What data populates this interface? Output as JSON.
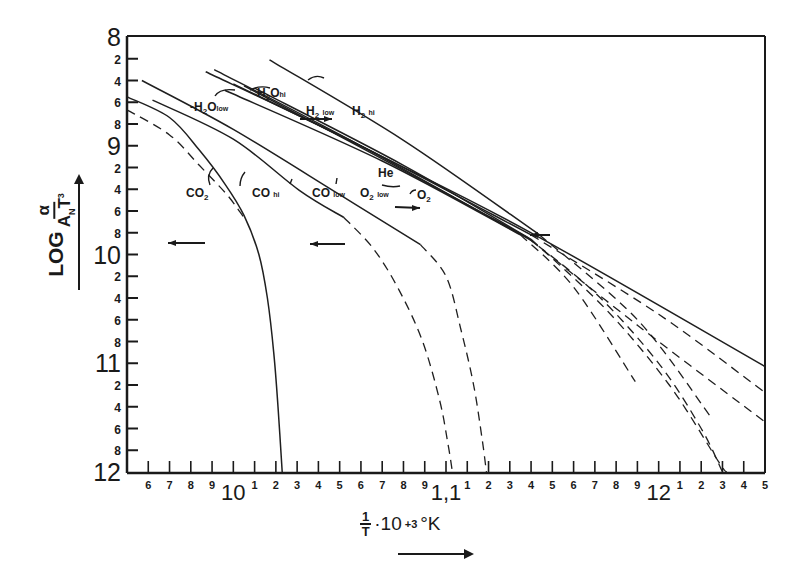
{
  "chart_data": {
    "type": "line",
    "title": "",
    "xlabel": "1/T · 10^+3 °K",
    "ylabel": "LOG α/(A_N T³)",
    "xlim": [
      0.95,
      1.25
    ],
    "ylim": [
      8,
      12
    ],
    "y_inverted": true,
    "grid": false,
    "legend_position": "inline annotations",
    "x_ticks": [
      {
        "value": 0.96,
        "label": "6"
      },
      {
        "value": 0.97,
        "label": "7"
      },
      {
        "value": 0.98,
        "label": "8"
      },
      {
        "value": 0.99,
        "label": "9"
      },
      {
        "value": 1.0,
        "label": "10"
      },
      {
        "value": 1.01,
        "label": "1"
      },
      {
        "value": 1.02,
        "label": "2"
      },
      {
        "value": 1.03,
        "label": "3"
      },
      {
        "value": 1.04,
        "label": "4"
      },
      {
        "value": 1.05,
        "label": "5"
      },
      {
        "value": 1.06,
        "label": "6"
      },
      {
        "value": 1.07,
        "label": "7"
      },
      {
        "value": 1.08,
        "label": "8"
      },
      {
        "value": 1.09,
        "label": "9"
      },
      {
        "value": 1.1,
        "label": "1,1"
      },
      {
        "value": 1.11,
        "label": "1"
      },
      {
        "value": 1.12,
        "label": "2"
      },
      {
        "value": 1.13,
        "label": "3"
      },
      {
        "value": 1.14,
        "label": "4"
      },
      {
        "value": 1.15,
        "label": "5"
      },
      {
        "value": 1.16,
        "label": "6"
      },
      {
        "value": 1.17,
        "label": "7"
      },
      {
        "value": 1.18,
        "label": "8"
      },
      {
        "value": 1.19,
        "label": "9"
      },
      {
        "value": 1.2,
        "label": "12"
      },
      {
        "value": 1.21,
        "label": "1"
      },
      {
        "value": 1.22,
        "label": "2"
      },
      {
        "value": 1.23,
        "label": "3"
      },
      {
        "value": 1.24,
        "label": "4"
      },
      {
        "value": 1.25,
        "label": "5"
      }
    ],
    "y_ticks": [
      {
        "value": 8.0,
        "label": "8",
        "major": true
      },
      {
        "value": 8.2,
        "label": "2"
      },
      {
        "value": 8.4,
        "label": "4"
      },
      {
        "value": 8.6,
        "label": "6"
      },
      {
        "value": 8.8,
        "label": "8"
      },
      {
        "value": 9.0,
        "label": "9",
        "major": true
      },
      {
        "value": 9.2,
        "label": "2"
      },
      {
        "value": 9.4,
        "label": "4"
      },
      {
        "value": 9.6,
        "label": "6"
      },
      {
        "value": 9.8,
        "label": "8"
      },
      {
        "value": 10.0,
        "label": "10",
        "major": true
      },
      {
        "value": 10.2,
        "label": "2"
      },
      {
        "value": 10.4,
        "label": "4"
      },
      {
        "value": 10.6,
        "label": "6"
      },
      {
        "value": 10.8,
        "label": "8"
      },
      {
        "value": 11.0,
        "label": "11",
        "major": true
      },
      {
        "value": 11.2,
        "label": "2"
      },
      {
        "value": 11.4,
        "label": "4"
      },
      {
        "value": 11.6,
        "label": "6"
      },
      {
        "value": 11.8,
        "label": "8"
      },
      {
        "value": 12.0,
        "label": "12",
        "major": true
      }
    ],
    "series": [
      {
        "name": "CO2",
        "style": "solid",
        "points": [
          [
            0.95,
            8.55
          ],
          [
            0.97,
            8.74
          ],
          [
            0.984,
            9.04
          ],
          [
            0.996,
            9.35
          ],
          [
            1.005,
            9.64
          ],
          [
            1.012,
            10.0
          ],
          [
            1.016,
            10.4
          ],
          [
            1.019,
            10.9
          ],
          [
            1.021,
            11.4
          ],
          [
            1.023,
            12.0
          ]
        ]
      },
      {
        "name": "CO2 (dashed)",
        "style": "dashed",
        "points": [
          [
            0.95,
            8.67
          ],
          [
            0.97,
            8.9
          ],
          [
            0.984,
            9.18
          ],
          [
            0.997,
            9.45
          ],
          [
            1.005,
            9.66
          ]
        ]
      },
      {
        "name": "CO hi",
        "style": "solid",
        "points": [
          [
            0.962,
            8.58
          ],
          [
            1.0,
            8.94
          ],
          [
            1.031,
            9.41
          ],
          [
            1.052,
            9.66
          ]
        ]
      },
      {
        "name": "CO hi (extrap.)",
        "style": "dashed",
        "points": [
          [
            1.052,
            9.66
          ],
          [
            1.066,
            9.95
          ],
          [
            1.078,
            10.33
          ],
          [
            1.089,
            10.8
          ],
          [
            1.097,
            11.34
          ],
          [
            1.101,
            11.75
          ],
          [
            1.103,
            12.0
          ]
        ]
      },
      {
        "name": "CO low",
        "style": "solid",
        "points": [
          [
            0.957,
            8.4
          ],
          [
            1.0,
            8.85
          ],
          [
            1.05,
            9.45
          ],
          [
            1.088,
            9.91
          ]
        ]
      },
      {
        "name": "CO low (extrap.)",
        "style": "dashed",
        "points": [
          [
            1.088,
            9.91
          ],
          [
            1.1,
            10.2
          ],
          [
            1.107,
            10.69
          ],
          [
            1.113,
            11.2
          ],
          [
            1.117,
            11.7
          ],
          [
            1.119,
            12.0
          ]
        ]
      },
      {
        "name": "O2 low",
        "style": "solid",
        "points": [
          [
            0.991,
            8.3
          ],
          [
            1.06,
            9.0
          ],
          [
            1.14,
            9.87
          ]
        ]
      },
      {
        "name": "O2 low (extrap.)",
        "style": "dashed",
        "points": [
          [
            1.14,
            9.87
          ],
          [
            1.19,
            10.65
          ],
          [
            1.25,
            11.54
          ]
        ]
      },
      {
        "name": "H2O low",
        "style": "solid",
        "points": [
          [
            0.996,
            8.49
          ],
          [
            1.07,
            9.14
          ],
          [
            1.135,
            9.82
          ]
        ]
      },
      {
        "name": "H2O low (extrap.)",
        "style": "dashed",
        "points": [
          [
            1.135,
            9.82
          ],
          [
            1.16,
            10.3
          ],
          [
            1.189,
            11.17
          ]
        ]
      },
      {
        "name": "H2O hi",
        "style": "solid",
        "points": [
          [
            1.0,
            8.43
          ],
          [
            1.07,
            9.1
          ],
          [
            1.14,
            9.8
          ],
          [
            1.25,
            11.03
          ]
        ]
      },
      {
        "name": "He",
        "style": "solid",
        "points": [
          [
            1.005,
            8.45
          ],
          [
            1.07,
            9.12
          ],
          [
            1.138,
            9.84
          ]
        ]
      },
      {
        "name": "He (extrap.)",
        "style": "dashed",
        "points": [
          [
            1.138,
            9.84
          ],
          [
            1.17,
            10.35
          ],
          [
            1.2,
            11.0
          ],
          [
            1.22,
            11.6
          ],
          [
            1.23,
            12.0
          ]
        ]
      },
      {
        "name": "O2 hi",
        "style": "solid",
        "points": [
          [
            1.01,
            8.47
          ],
          [
            1.08,
            9.18
          ],
          [
            1.14,
            9.86
          ]
        ]
      },
      {
        "name": "O2 hi (extrap.)",
        "style": "dashed",
        "points": [
          [
            1.14,
            9.86
          ],
          [
            1.175,
            10.5
          ],
          [
            1.205,
            11.2
          ],
          [
            1.228,
            11.9
          ],
          [
            1.232,
            12.0
          ]
        ]
      },
      {
        "name": "H2 low",
        "style": "solid",
        "points": [
          [
            0.987,
            8.32
          ],
          [
            1.06,
            9.0
          ],
          [
            1.14,
            9.82
          ]
        ]
      },
      {
        "name": "H2 low (extrap.)",
        "style": "dashed",
        "points": [
          [
            1.14,
            9.82
          ],
          [
            1.2,
            10.55
          ],
          [
            1.25,
            11.27
          ]
        ]
      },
      {
        "name": "H2 hi",
        "style": "solid",
        "points": [
          [
            1.017,
            8.21
          ],
          [
            1.08,
            8.95
          ],
          [
            1.144,
            9.82
          ]
        ]
      },
      {
        "name": "H2 hi (extrap.)",
        "style": "dashed",
        "points": [
          [
            1.144,
            9.82
          ],
          [
            1.19,
            10.6
          ],
          [
            1.224,
            11.48
          ]
        ]
      }
    ],
    "annotations": [
      {
        "text": "H₂O hi",
        "x": 1.027,
        "y": 8.54
      },
      {
        "text": "-H₂O low",
        "x": 0.98,
        "y": 8.67
      },
      {
        "text": "H₂ low",
        "x": 1.06,
        "y": 8.72
      },
      {
        "text": "H₂ hi",
        "x": 1.1,
        "y": 8.72
      },
      {
        "text": "He",
        "x": 1.065,
        "y": 9.28
      },
      {
        "text": "O₂ hi",
        "x": 1.083,
        "y": 9.52
      },
      {
        "text": "CO₂",
        "x": 0.978,
        "y": 9.56
      },
      {
        "text": "CO hi",
        "x": 1.02,
        "y": 9.56
      },
      {
        "text": "CO low",
        "x": 1.054,
        "y": 9.56
      },
      {
        "text": "O₂ low",
        "x": 1.093,
        "y": 9.56
      }
    ]
  },
  "labels": {
    "y_log": "LOG",
    "y_num": "α",
    "y_den_A": "A",
    "y_den_sub": "N",
    "y_den_T": "T",
    "y_den_sup": "3",
    "x_num": "1",
    "x_den": "T",
    "x_mult": "·10",
    "x_exp": "+3",
    "x_unit": "°K"
  },
  "annotation_labels": {
    "h2o_hi": "H",
    "h2o_low": "-H",
    "h2_low": "H",
    "h2_hi": "H",
    "he": "He",
    "o2_hi": "O",
    "co2": "CO",
    "co_hi": "CO",
    "co_low": "CO",
    "o2_low": "O",
    "sub2": "2",
    "o_suffix": "O",
    "hi": "hi",
    "low": "low"
  }
}
